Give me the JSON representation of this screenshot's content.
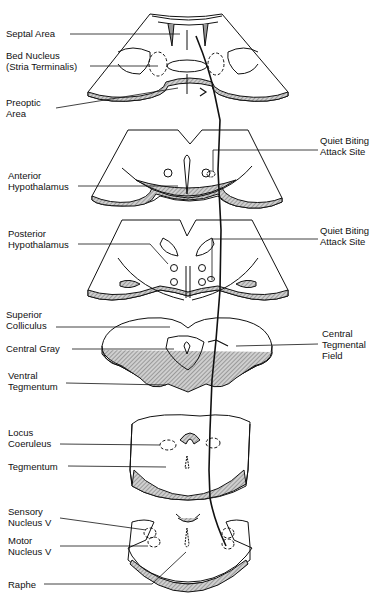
{
  "figure": {
    "sections": [
      {
        "id": "forebrain",
        "labels_left": [
          [
            "Septal Area"
          ],
          [
            "Bed Nucleus",
            "(Stria Terminalis)"
          ],
          [
            "Preoptic",
            "Area"
          ]
        ],
        "labels_right": []
      },
      {
        "id": "anterior-hypothalamus",
        "labels_left": [
          [
            "Anterior",
            "Hypothalamus"
          ]
        ],
        "labels_right": [
          [
            "Quiet Biting",
            "Attack Site"
          ]
        ]
      },
      {
        "id": "posterior-hypothalamus",
        "labels_left": [
          [
            "Posterior",
            "Hypothalamus"
          ]
        ],
        "labels_right": [
          [
            "Quiet Biting",
            "Attack Site"
          ]
        ]
      },
      {
        "id": "midbrain",
        "labels_left": [
          [
            "Superior",
            "Colliculus"
          ],
          [
            "Central Gray"
          ],
          [
            "Ventral",
            "Tegmentum"
          ]
        ],
        "labels_right": [
          [
            "Central",
            "Tegmental",
            "Field"
          ]
        ]
      },
      {
        "id": "pons",
        "labels_left": [
          [
            "Locus",
            "Coeruleus"
          ],
          [
            "Tegmentum"
          ]
        ],
        "labels_right": []
      },
      {
        "id": "medulla",
        "labels_left": [
          [
            "Sensory",
            "Nucleus V"
          ],
          [
            "Motor",
            "Nucleus V"
          ],
          [
            "Raphe"
          ]
        ],
        "labels_right": []
      }
    ]
  },
  "labels": {
    "septal_area": "Septal Area",
    "bed_nucleus_1": "Bed Nucleus",
    "bed_nucleus_2": "(Stria Terminalis)",
    "preoptic_1": "Preoptic",
    "preoptic_2": "Area",
    "qba1_1": "Quiet Biting",
    "qba1_2": "Attack Site",
    "ant_hyp_1": "Anterior",
    "ant_hyp_2": "Hypothalamus",
    "qba2_1": "Quiet Biting",
    "qba2_2": "Attack Site",
    "post_hyp_1": "Posterior",
    "post_hyp_2": "Hypothalamus",
    "sup_coll_1": "Superior",
    "sup_coll_2": "Colliculus",
    "central_gray": "Central Gray",
    "ctf_1": "Central",
    "ctf_2": "Tegmental",
    "ctf_3": "Field",
    "vent_teg_1": "Ventral",
    "vent_teg_2": "Tegmentum",
    "locus_1": "Locus",
    "locus_2": "Coeruleus",
    "tegmentum": "Tegmentum",
    "sensory_1": "Sensory",
    "sensory_2": "Nucleus V",
    "motor_1": "Motor",
    "motor_2": "Nucleus V",
    "raphe": "Raphe"
  },
  "colors": {
    "line": "#111111",
    "hatch": "#9a9a9a",
    "fill": "#ffffff"
  }
}
